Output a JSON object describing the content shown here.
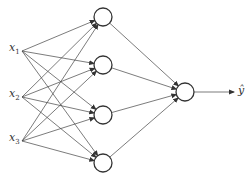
{
  "diagram": {
    "type": "feedforward-neural-network",
    "inputs": [
      {
        "name": "x",
        "sub": "1",
        "x": 22,
        "y": 51
      },
      {
        "name": "x",
        "sub": "2",
        "x": 22,
        "y": 97
      },
      {
        "name": "x",
        "sub": "3",
        "x": 22,
        "y": 141
      }
    ],
    "hidden": [
      {
        "x": 103,
        "y": 17
      },
      {
        "x": 103,
        "y": 65
      },
      {
        "x": 103,
        "y": 115
      },
      {
        "x": 103,
        "y": 163
      }
    ],
    "output": {
      "x": 185,
      "y": 92,
      "label": "ŷ"
    },
    "node_radius": 9,
    "arrow_end_x": 234
  }
}
